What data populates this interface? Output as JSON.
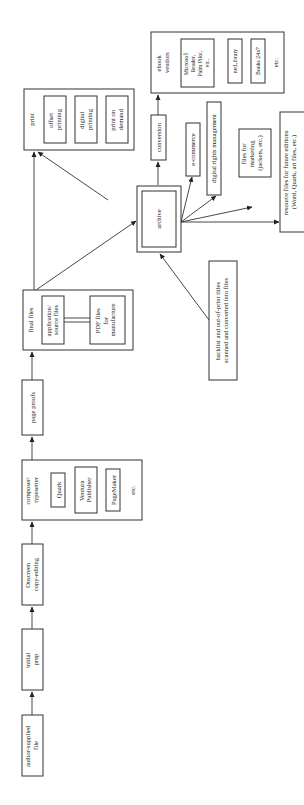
{
  "diagram": {
    "orientation": "rotated-90-ccw",
    "nodes": {
      "author": {
        "lines": [
          "author-supplied",
          "file"
        ]
      },
      "prep": {
        "lines": [
          "initial",
          "prep"
        ]
      },
      "copyedit": {
        "lines": [
          "Onscreen",
          "copy-editing"
        ]
      },
      "composer": {
        "lines": [
          "composer/",
          "typesetter"
        ],
        "tools": [
          {
            "lines": [
              "Quark"
            ]
          },
          {
            "lines": [
              "Ventura",
              "Publisher"
            ]
          },
          {
            "lines": [
              "PageMaker"
            ]
          }
        ],
        "etc": "etc."
      },
      "proofs": {
        "lines": [
          "page proofs"
        ]
      },
      "final": {
        "lines": [
          "final files"
        ],
        "source": {
          "lines": [
            "application/",
            "source files"
          ]
        },
        "pdf": {
          "lines": [
            "PDF files",
            "for",
            "manufacture"
          ]
        }
      },
      "print": {
        "lines": [
          "print"
        ],
        "options": [
          {
            "lines": [
              "offset",
              "printing"
            ]
          },
          {
            "lines": [
              "digital",
              "printing"
            ]
          },
          {
            "lines": [
              "print on",
              "demand"
            ]
          }
        ]
      },
      "archive": {
        "lines": [
          "archive"
        ]
      },
      "conversion": {
        "lines": [
          "conversion"
        ]
      },
      "ebook": {
        "lines": [
          "ebook",
          "vendors"
        ],
        "vendors": [
          {
            "lines": [
              "Microsoft",
              "Reader,",
              "Palm Pilot,",
              "etc."
            ]
          },
          {
            "lines": [
              "netLibrary"
            ]
          },
          {
            "lines": [
              "Books 24x7"
            ]
          }
        ],
        "etc": "etc."
      },
      "ecommerce": {
        "lines": [
          "e-commerce"
        ]
      },
      "drm": {
        "lines": [
          "digital rights management"
        ]
      },
      "marketing": {
        "lines": [
          "files for",
          "marketing",
          "(jackets, etc.)"
        ]
      },
      "resource": {
        "lines": [
          "resource files for future editions",
          "(Word, Quark, art files, etc.)"
        ]
      },
      "backlist": {
        "lines": [
          "backlist and out-of-print titles",
          "scanned and converted into files"
        ]
      }
    }
  }
}
